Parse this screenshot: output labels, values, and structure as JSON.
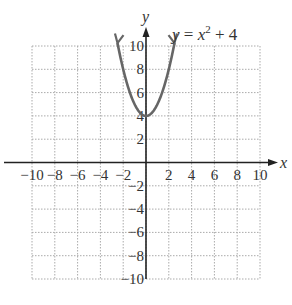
{
  "chart_data": {
    "type": "line",
    "equation": {
      "lhs": "y",
      "eq": " = ",
      "base": "x",
      "exp": "2",
      "rest": " + 4"
    },
    "xlabel": "x",
    "ylabel": "y",
    "xlim": [
      -10,
      10
    ],
    "ylim": [
      -10,
      10
    ],
    "grid": true,
    "x_ticks": [
      -10,
      -8,
      -6,
      -4,
      -2,
      2,
      4,
      6,
      8,
      10
    ],
    "y_ticks": [
      10,
      8,
      6,
      4,
      2,
      -2,
      -4,
      -6,
      -8,
      -10
    ],
    "series": [
      {
        "name": "y = x^2 + 4",
        "color": "#666666",
        "x": [
          -2.5,
          -2,
          -1.5,
          -1,
          -0.5,
          0,
          0.5,
          1,
          1.5,
          2,
          2.5
        ],
        "y": [
          10.25,
          8,
          6.25,
          5,
          4.25,
          4,
          4.25,
          5,
          6.25,
          8,
          10.25
        ]
      }
    ]
  }
}
